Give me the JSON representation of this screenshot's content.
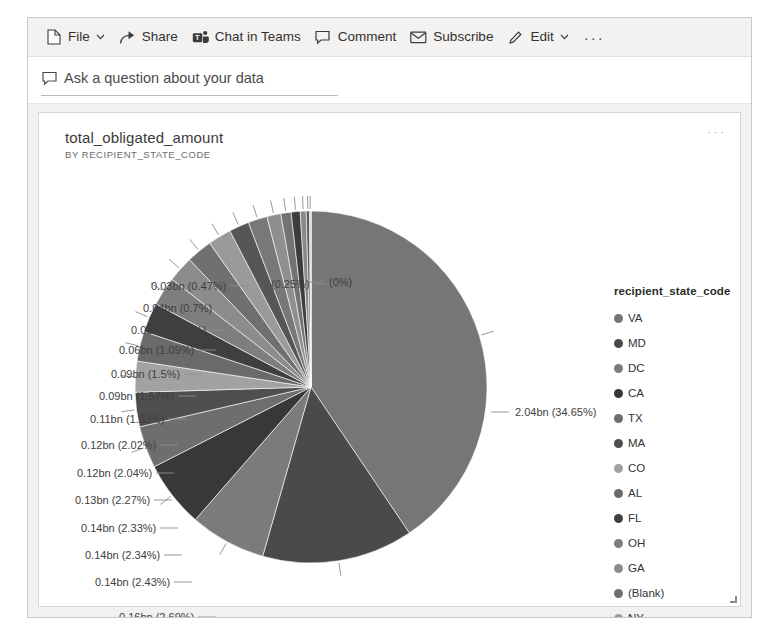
{
  "command_bar": {
    "items": [
      {
        "label": "File",
        "icon": "file-icon",
        "has_chevron": true
      },
      {
        "label": "Share",
        "icon": "share-icon",
        "has_chevron": false
      },
      {
        "label": "Chat in Teams",
        "icon": "teams-icon",
        "has_chevron": false
      },
      {
        "label": "Comment",
        "icon": "comment-icon",
        "has_chevron": false
      },
      {
        "label": "Subscribe",
        "icon": "envelope-icon",
        "has_chevron": false
      },
      {
        "label": "Edit",
        "icon": "pencil-icon",
        "has_chevron": true
      }
    ],
    "overflow_label": "···"
  },
  "qna": {
    "icon": "qna-speech-bubble-icon",
    "placeholder": "Ask a question about your data"
  },
  "visual": {
    "title": "total_obligated_amount",
    "subtitle": "BY RECIPIENT_STATE_CODE",
    "more_options_label": "···"
  },
  "legend": {
    "title": "recipient_state_code",
    "items": [
      {
        "label": "VA",
        "color": "#767676"
      },
      {
        "label": "MD",
        "color": "#4a4a4a"
      },
      {
        "label": "DC",
        "color": "#7b7b7b"
      },
      {
        "label": "CA",
        "color": "#383838"
      },
      {
        "label": "TX",
        "color": "#6e6e6e"
      },
      {
        "label": "MA",
        "color": "#4f4f4f"
      },
      {
        "label": "CO",
        "color": "#a2a2a2"
      },
      {
        "label": "AL",
        "color": "#6a6a6a"
      },
      {
        "label": "FL",
        "color": "#3f3f3f"
      },
      {
        "label": "OH",
        "color": "#7e7e7e"
      },
      {
        "label": "GA",
        "color": "#8c8c8c"
      },
      {
        "label": "(Blank)",
        "color": "#707070"
      },
      {
        "label": "NY",
        "color": "#9a9a9a"
      },
      {
        "label": "PA",
        "color": "#565656"
      },
      {
        "label": "NC",
        "color": "#787878"
      },
      {
        "label": "IL",
        "color": "#8f8f8f"
      },
      {
        "label": "WA",
        "color": "#737373"
      }
    ]
  },
  "chart_data": {
    "type": "pie",
    "title": "total_obligated_amount",
    "subtitle": "BY RECIPIENT_STATE_CODE",
    "legend_title": "recipient_state_code",
    "legend_position": "right",
    "value_unit": "bn",
    "categories": [
      "VA",
      "MD",
      "DC",
      "CA",
      "TX",
      "MA",
      "CO",
      "AL",
      "FL",
      "OH",
      "GA",
      "(Blank)",
      "NY",
      "PA",
      "NC",
      "IL",
      "WA",
      "other-1",
      "other-2",
      "other-3",
      "other-4",
      "other-5"
    ],
    "values": [
      2.04,
      0.7,
      0.35,
      0.31,
      0.19,
      0.16,
      0.14,
      0.14,
      0.14,
      0.13,
      0.12,
      0.12,
      0.11,
      0.09,
      0.09,
      0.06,
      0.05,
      0.04,
      0.03,
      0.015,
      0.008,
      0.002
    ],
    "percentages": [
      34.65,
      11.84,
      5.97,
      5.21,
      3.29,
      2.69,
      2.43,
      2.34,
      2.33,
      2.27,
      2.04,
      2.02,
      1.83,
      1.57,
      1.5,
      1.09,
      0.81,
      0.7,
      0.47,
      0.25,
      0.12,
      0.0
    ],
    "colors": [
      "#767676",
      "#4a4a4a",
      "#7b7b7b",
      "#383838",
      "#6e6e6e",
      "#4f4f4f",
      "#a2a2a2",
      "#6a6a6a",
      "#3f3f3f",
      "#7e7e7e",
      "#8c8c8c",
      "#707070",
      "#9a9a9a",
      "#565656",
      "#787878",
      "#8f8f8f",
      "#737373",
      "#3c3c3c",
      "#8a8a8a",
      "#5a5a5a",
      "#9e9e9e",
      "#6c6c6c"
    ],
    "data_labels": [
      {
        "text": "2.04bn (34.65%)",
        "value": 2.04,
        "percent": 34.65
      },
      {
        "text": "0.7bn (11.84%)",
        "value": 0.7,
        "percent": 11.84
      },
      {
        "text": "0.35bn (5.97%)",
        "value": 0.35,
        "percent": 5.97
      },
      {
        "text": "0.31bn (5.21%)",
        "value": 0.31,
        "percent": 5.21
      },
      {
        "text": "0.19bn (3.29%)",
        "value": 0.19,
        "percent": 3.29
      },
      {
        "text": "0.16bn (2.69%)",
        "value": 0.16,
        "percent": 2.69
      },
      {
        "text": "0.14bn (2.43%)",
        "value": 0.14,
        "percent": 2.43
      },
      {
        "text": "0.14bn (2.34%)",
        "value": 0.14,
        "percent": 2.34
      },
      {
        "text": "0.14bn (2.33%)",
        "value": 0.14,
        "percent": 2.33
      },
      {
        "text": "0.13bn (2.27%)",
        "value": 0.13,
        "percent": 2.27
      },
      {
        "text": "0.12bn (2.04%)",
        "value": 0.12,
        "percent": 2.04
      },
      {
        "text": "0.12bn (2.02%)",
        "value": 0.12,
        "percent": 2.02
      },
      {
        "text": "0.11bn (1.83%)",
        "value": 0.11,
        "percent": 1.83
      },
      {
        "text": "0.09bn (1.57%)",
        "value": 0.09,
        "percent": 1.57
      },
      {
        "text": "0.09bn (1.5%)",
        "value": 0.09,
        "percent": 1.5
      },
      {
        "text": "0.06bn (1.09%)",
        "value": 0.06,
        "percent": 1.09
      },
      {
        "text": "0.05bn (0.81%)",
        "value": 0.05,
        "percent": 0.81
      },
      {
        "text": "0.04bn (0.7%)",
        "value": 0.04,
        "percent": 0.7
      },
      {
        "text": "0.03bn (0.47%)",
        "value": 0.03,
        "percent": 0.47
      },
      {
        "text": "(0.25%)",
        "value": null,
        "percent": 0.25
      },
      {
        "text": "(0%)",
        "value": null,
        "percent": 0
      }
    ]
  },
  "label_positions": [
    {
      "text_ref": "0.03bn (0.47%)",
      "x": 112,
      "y": 168
    },
    {
      "text_ref": "(0.25%)",
      "x": 232,
      "y": 166
    },
    {
      "text_ref": "(0%)",
      "x": 290,
      "y": 164
    },
    {
      "text_ref": "0.04bn (0.7%)",
      "x": 104,
      "y": 190
    },
    {
      "text_ref": "0.05bn (0.81%)",
      "x": 92,
      "y": 212
    },
    {
      "text_ref": "0.06bn (1.09%)",
      "x": 80,
      "y": 232
    },
    {
      "text_ref": "0.09bn (1.5%)",
      "x": 72,
      "y": 256
    },
    {
      "text_ref": "0.09bn (1.57%)",
      "x": 60,
      "y": 278
    },
    {
      "text_ref": "0.11bn (1.83%)",
      "x": 51,
      "y": 301
    },
    {
      "text_ref": "0.12bn (2.02%)",
      "x": 42,
      "y": 327
    },
    {
      "text_ref": "0.12bn (2.04%)",
      "x": 38,
      "y": 355
    },
    {
      "text_ref": "0.13bn (2.27%)",
      "x": 36,
      "y": 382
    },
    {
      "text_ref": "0.14bn (2.33%)",
      "x": 42,
      "y": 410
    },
    {
      "text_ref": "0.14bn (2.34%)",
      "x": 46,
      "y": 437
    },
    {
      "text_ref": "0.14bn (2.43%)",
      "x": 56,
      "y": 464
    },
    {
      "text_ref": "0.16bn (2.69%)",
      "x": 80,
      "y": 499
    },
    {
      "text_ref": "0.19bn (3.29%)",
      "x": 103,
      "y": 528
    },
    {
      "text_ref": "0.31bn (5.21%)",
      "x": 136,
      "y": 549
    },
    {
      "text_ref": "0.35bn (5.97%)",
      "x": 336,
      "y": 567
    },
    {
      "text_ref": "0.7bn (11.84%)",
      "x": 419,
      "y": 538
    },
    {
      "text_ref": "2.04bn (34.65%)",
      "x": 476,
      "y": 294
    }
  ]
}
